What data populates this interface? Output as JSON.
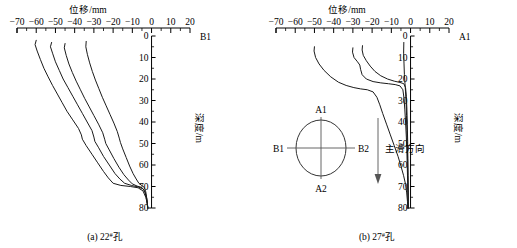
{
  "figure": {
    "x_axis_title": "位移/mm",
    "y_axis_title": "深度/m",
    "x_ticks": [
      "-70",
      "-60",
      "-50",
      "-40",
      "-30",
      "-20",
      "-10",
      "0",
      "10",
      "20"
    ],
    "y_ticks": [
      "0",
      "10",
      "20",
      "30",
      "40",
      "50",
      "60",
      "70",
      "80"
    ]
  },
  "panel_a": {
    "corner_label": "B1",
    "caption_prefix": "(a) 22",
    "caption_sup": "#",
    "caption_suffix": "孔"
  },
  "panel_b": {
    "corner_label": "A1",
    "caption_prefix": "(b) 27",
    "caption_sup": "#",
    "caption_suffix": "孔",
    "inset": {
      "label_top": "A1",
      "label_bottom": "A2",
      "label_left": "B1",
      "label_right": "B2",
      "arrow_label": "主滑方向"
    }
  },
  "chart_data": [
    {
      "type": "line",
      "id": "panel-a",
      "title": "(a) 22#孔",
      "xlabel": "位移/mm",
      "ylabel": "深度/m",
      "xlim": [
        -70,
        20
      ],
      "ylim": [
        0,
        80
      ],
      "y_inverted": true,
      "grid": false,
      "legend": null,
      "axis_corner_label": "B1",
      "xticks": [
        -70,
        -60,
        -50,
        -40,
        -30,
        -20,
        -10,
        0,
        10,
        20
      ],
      "yticks": [
        0,
        10,
        20,
        30,
        40,
        50,
        60,
        70,
        80
      ],
      "series": [
        {
          "name": "curve-1",
          "points": [
            [
              -60.0,
              2.0
            ],
            [
              -60.6,
              4.0
            ],
            [
              -59.5,
              7.0
            ],
            [
              -57.8,
              11.0
            ],
            [
              -56.0,
              15.0
            ],
            [
              -53.8,
              19.0
            ],
            [
              -51.5,
              23.0
            ],
            [
              -49.0,
              27.0
            ],
            [
              -46.5,
              31.0
            ],
            [
              -44.0,
              35.0
            ],
            [
              -41.0,
              39.0
            ],
            [
              -38.0,
              43.0
            ],
            [
              -36.5,
              46.0
            ],
            [
              -36.0,
              48.0
            ],
            [
              -34.0,
              51.0
            ],
            [
              -31.0,
              55.0
            ],
            [
              -28.0,
              59.0
            ],
            [
              -25.0,
              63.0
            ],
            [
              -22.5,
              66.0
            ],
            [
              -20.0,
              68.5
            ],
            [
              -16.0,
              69.5
            ],
            [
              -11.0,
              70.0
            ],
            [
              -7.0,
              70.6
            ],
            [
              -4.5,
              72.0
            ],
            [
              -3.0,
              75.0
            ],
            [
              -2.2,
              78.0
            ],
            [
              -2.0,
              80.0
            ]
          ]
        },
        {
          "name": "curve-2",
          "points": [
            [
              -52.0,
              3.0
            ],
            [
              -52.6,
              5.0
            ],
            [
              -51.5,
              8.0
            ],
            [
              -50.0,
              12.0
            ],
            [
              -48.0,
              16.0
            ],
            [
              -46.0,
              20.0
            ],
            [
              -43.5,
              24.0
            ],
            [
              -41.0,
              28.0
            ],
            [
              -38.5,
              32.0
            ],
            [
              -36.0,
              36.0
            ],
            [
              -33.5,
              40.0
            ],
            [
              -31.0,
              44.0
            ],
            [
              -30.0,
              47.0
            ],
            [
              -29.5,
              49.0
            ],
            [
              -27.5,
              52.0
            ],
            [
              -25.0,
              56.0
            ],
            [
              -22.0,
              60.0
            ],
            [
              -19.0,
              64.0
            ],
            [
              -16.5,
              66.5
            ],
            [
              -14.0,
              68.5
            ],
            [
              -10.5,
              69.5
            ],
            [
              -7.0,
              70.2
            ],
            [
              -4.5,
              71.0
            ],
            [
              -3.2,
              73.0
            ],
            [
              -2.4,
              76.0
            ],
            [
              -2.0,
              80.0
            ]
          ]
        },
        {
          "name": "curve-3",
          "points": [
            [
              -45.0,
              3.5
            ],
            [
              -45.4,
              5.5
            ],
            [
              -44.4,
              9.0
            ],
            [
              -43.0,
              13.0
            ],
            [
              -41.2,
              17.0
            ],
            [
              -39.2,
              21.0
            ],
            [
              -37.0,
              25.0
            ],
            [
              -34.8,
              29.0
            ],
            [
              -32.4,
              33.0
            ],
            [
              -30.0,
              37.0
            ],
            [
              -27.6,
              41.0
            ],
            [
              -25.4,
              45.0
            ],
            [
              -24.4,
              48.0
            ],
            [
              -23.8,
              50.0
            ],
            [
              -22.0,
              53.0
            ],
            [
              -19.6,
              57.0
            ],
            [
              -17.0,
              61.0
            ],
            [
              -14.4,
              64.5
            ],
            [
              -12.0,
              67.0
            ],
            [
              -10.0,
              68.8
            ],
            [
              -7.5,
              69.8
            ],
            [
              -5.2,
              70.4
            ],
            [
              -3.6,
              72.0
            ],
            [
              -2.8,
              75.0
            ],
            [
              -2.2,
              78.0
            ],
            [
              -2.0,
              80.0
            ]
          ]
        },
        {
          "name": "curve-4",
          "points": [
            [
              -34.0,
              2.5
            ],
            [
              -34.2,
              5.0
            ],
            [
              -33.4,
              8.5
            ],
            [
              -32.2,
              12.5
            ],
            [
              -30.8,
              16.5
            ],
            [
              -29.2,
              20.5
            ],
            [
              -27.4,
              24.5
            ],
            [
              -25.6,
              28.5
            ],
            [
              -23.6,
              32.5
            ],
            [
              -21.6,
              36.5
            ],
            [
              -19.6,
              40.5
            ],
            [
              -17.8,
              44.5
            ],
            [
              -16.8,
              47.5
            ],
            [
              -16.2,
              49.5
            ],
            [
              -15.0,
              52.5
            ],
            [
              -13.2,
              56.5
            ],
            [
              -11.4,
              60.5
            ],
            [
              -9.6,
              64.0
            ],
            [
              -8.0,
              66.5
            ],
            [
              -6.6,
              68.5
            ],
            [
              -5.0,
              69.6
            ],
            [
              -3.8,
              70.4
            ],
            [
              -3.0,
              72.5
            ],
            [
              -2.4,
              76.0
            ],
            [
              -2.0,
              80.0
            ]
          ]
        }
      ]
    },
    {
      "type": "line",
      "id": "panel-b",
      "title": "(b) 27#孔",
      "xlabel": "位移/mm",
      "ylabel": "深度/m",
      "xlim": [
        -70,
        20
      ],
      "ylim": [
        0,
        80
      ],
      "y_inverted": true,
      "grid": false,
      "legend": null,
      "axis_corner_label": "A1",
      "xticks": [
        -70,
        -60,
        -50,
        -40,
        -30,
        -20,
        -10,
        0,
        10,
        20
      ],
      "yticks": [
        0,
        10,
        20,
        30,
        40,
        50,
        60,
        70,
        80
      ],
      "series": [
        {
          "name": "curve-1",
          "points": [
            [
              -50.0,
              5.0
            ],
            [
              -50.2,
              7.0
            ],
            [
              -49.4,
              10.0
            ],
            [
              -47.6,
              13.0
            ],
            [
              -45.0,
              16.0
            ],
            [
              -41.5,
              19.0
            ],
            [
              -37.5,
              21.5
            ],
            [
              -33.5,
              23.0
            ],
            [
              -29.5,
              24.0
            ],
            [
              -26.0,
              24.6
            ],
            [
              -22.5,
              25.0
            ],
            [
              -19.5,
              26.0
            ],
            [
              -17.5,
              28.5
            ],
            [
              -16.0,
              32.0
            ],
            [
              -14.5,
              36.0
            ],
            [
              -12.5,
              41.0
            ],
            [
              -10.5,
              46.0
            ],
            [
              -8.5,
              51.0
            ],
            [
              -6.5,
              56.0
            ],
            [
              -5.0,
              60.5
            ],
            [
              -3.6,
              65.0
            ],
            [
              -2.6,
              69.0
            ],
            [
              -2.0,
              73.0
            ],
            [
              -1.6,
              77.0
            ],
            [
              -1.4,
              80.0
            ]
          ]
        },
        {
          "name": "curve-2",
          "points": [
            [
              -30.0,
              5.5
            ],
            [
              -30.2,
              7.5
            ],
            [
              -29.4,
              10.0
            ],
            [
              -27.6,
              12.0
            ],
            [
              -26.4,
              13.5
            ],
            [
              -26.0,
              15.5
            ],
            [
              -25.2,
              18.0
            ],
            [
              -23.0,
              20.0
            ],
            [
              -19.5,
              21.2
            ],
            [
              -15.5,
              21.8
            ],
            [
              -11.5,
              22.2
            ],
            [
              -8.0,
              22.6
            ],
            [
              -5.5,
              23.2
            ],
            [
              -4.0,
              25.0
            ],
            [
              -3.4,
              29.0
            ],
            [
              -3.0,
              34.0
            ],
            [
              -2.6,
              40.0
            ],
            [
              -2.2,
              47.0
            ],
            [
              -1.9,
              54.0
            ],
            [
              -1.7,
              61.0
            ],
            [
              -1.5,
              68.0
            ],
            [
              -1.4,
              74.0
            ],
            [
              -1.3,
              80.0
            ]
          ]
        },
        {
          "name": "curve-3",
          "points": [
            [
              -25.0,
              4.5
            ],
            [
              -25.2,
              6.5
            ],
            [
              -24.6,
              9.0
            ],
            [
              -23.0,
              11.5
            ],
            [
              -21.0,
              14.0
            ],
            [
              -18.5,
              16.5
            ],
            [
              -15.5,
              18.5
            ],
            [
              -12.0,
              20.0
            ],
            [
              -8.5,
              21.0
            ],
            [
              -5.5,
              21.6
            ],
            [
              -3.5,
              22.2
            ],
            [
              -2.6,
              24.0
            ],
            [
              -2.2,
              28.0
            ],
            [
              -1.9,
              34.0
            ],
            [
              -1.7,
              41.0
            ],
            [
              -1.5,
              49.0
            ],
            [
              -1.4,
              57.0
            ],
            [
              -1.3,
              65.0
            ],
            [
              -1.2,
              73.0
            ],
            [
              -1.2,
              80.0
            ]
          ]
        },
        {
          "name": "curve-4",
          "points": [
            [
              -3.5,
              3.0
            ],
            [
              -3.6,
              8.0
            ],
            [
              -3.4,
              13.0
            ],
            [
              -3.2,
              18.0
            ],
            [
              -2.9,
              22.0
            ],
            [
              -2.6,
              26.0
            ],
            [
              -2.3,
              31.0
            ],
            [
              -2.1,
              37.0
            ],
            [
              -1.9,
              44.0
            ],
            [
              -1.7,
              51.0
            ],
            [
              -1.5,
              58.0
            ],
            [
              -1.4,
              65.0
            ],
            [
              -1.3,
              72.0
            ],
            [
              -1.2,
              80.0
            ]
          ]
        }
      ]
    }
  ]
}
